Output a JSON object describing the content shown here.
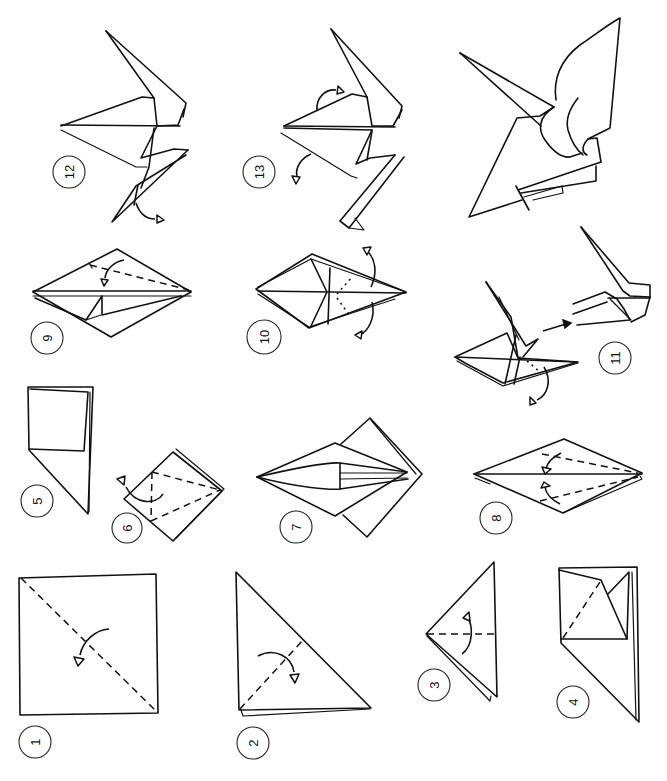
{
  "diagram": {
    "steps": [
      {
        "number": "1",
        "label": "1",
        "description": "Square with diagonal valley fold line and fold arrow"
      },
      {
        "number": "2",
        "label": "2",
        "description": "Triangle with dashed fold line and fold arrow"
      },
      {
        "number": "3",
        "label": "3",
        "description": "Smaller triangle with horizontal dashed fold and arrow"
      },
      {
        "number": "4",
        "label": "4",
        "description": "Squash fold in progress"
      },
      {
        "number": "5",
        "label": "5",
        "description": "Preliminary base with square flap"
      },
      {
        "number": "6",
        "label": "6",
        "description": "Square base with dashed petal fold lines and arrow"
      },
      {
        "number": "7",
        "label": "7",
        "description": "Bird base with narrowed flaps"
      },
      {
        "number": "8",
        "label": "8",
        "description": "Diamond shape with two dashed folds and arrows"
      },
      {
        "number": "9",
        "label": "9",
        "description": "Diamond with one dashed fold and arrow"
      },
      {
        "number": "10",
        "label": "10",
        "description": "Inside reverse folds with dotted lines and arrows"
      },
      {
        "number": "11",
        "label": "11",
        "description": "Reverse fold head; transition arrow to detail"
      },
      {
        "number": "12",
        "label": "12",
        "description": "Crane body with neck and tail; fold arrow"
      },
      {
        "number": "13",
        "label": "13",
        "description": "Fold wings down; arrows"
      },
      {
        "number": "14",
        "label": "",
        "description": "Finished crane"
      }
    ]
  }
}
